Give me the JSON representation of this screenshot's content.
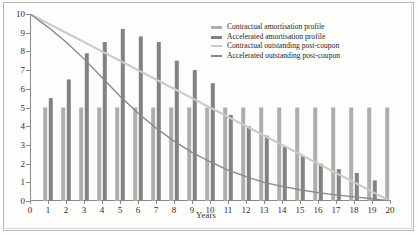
{
  "chart_data": {
    "type": "bar",
    "title": "",
    "subtitle": "",
    "xlabel": "Years",
    "ylabel": "",
    "xlim": [
      0,
      20
    ],
    "ylim": [
      0,
      10
    ],
    "grid": false,
    "legend_position": "top-right",
    "x": [
      0,
      1,
      2,
      3,
      4,
      5,
      6,
      7,
      8,
      9,
      10,
      11,
      12,
      13,
      14,
      15,
      16,
      17,
      18,
      19,
      20
    ],
    "categories": [
      "0",
      "1",
      "2",
      "3",
      "4",
      "5",
      "6",
      "7",
      "8",
      "9",
      "10",
      "11",
      "12",
      "13",
      "14",
      "15",
      "16",
      "17",
      "18",
      "19",
      "20"
    ],
    "y_ticks": [
      0,
      1,
      2,
      3,
      4,
      5,
      6,
      7,
      8,
      9,
      10
    ],
    "x_ticks": [
      0,
      1,
      2,
      3,
      4,
      5,
      6,
      7,
      8,
      9,
      10,
      11,
      12,
      13,
      14,
      15,
      16,
      17,
      18,
      19,
      20
    ],
    "series": [
      {
        "name": "Contractual amortisation profile",
        "kind": "bar",
        "color": "#b0aeaa",
        "values": [
          0,
          5.0,
          5.0,
          5.0,
          5.0,
          5.0,
          5.0,
          5.0,
          5.0,
          5.0,
          5.0,
          5.0,
          5.0,
          5.0,
          5.0,
          5.0,
          5.0,
          5.0,
          5.0,
          5.0,
          5.0
        ]
      },
      {
        "name": "Accelerated amortisation profile",
        "kind": "bar",
        "color": "#848280",
        "values": [
          0,
          5.5,
          6.5,
          7.9,
          8.5,
          9.2,
          8.8,
          8.5,
          7.5,
          7.0,
          6.3,
          4.6,
          4.0,
          3.5,
          2.9,
          2.4,
          2.0,
          1.7,
          1.5,
          1.1,
          0.85
        ]
      },
      {
        "name": "Contractual outstanding post-coupon",
        "kind": "line",
        "color": "#cdcbc7",
        "values": [
          10.0,
          9.5,
          9.0,
          8.5,
          8.0,
          7.5,
          7.0,
          6.5,
          6.0,
          5.5,
          5.0,
          4.5,
          4.0,
          3.5,
          3.0,
          2.5,
          2.0,
          1.5,
          1.0,
          0.5,
          0.0
        ]
      },
      {
        "name": "Accelerated outstanding post-coupon",
        "kind": "line",
        "color": "#8a8884",
        "values": [
          10.0,
          9.3,
          8.5,
          7.6,
          6.6,
          5.6,
          4.7,
          3.9,
          3.2,
          2.6,
          2.1,
          1.65,
          1.3,
          1.0,
          0.78,
          0.6,
          0.45,
          0.33,
          0.22,
          0.12,
          0.0
        ]
      }
    ]
  },
  "legend": {
    "items": [
      {
        "label": "Contractual amortisation profile",
        "color": "#b0aeaa",
        "marker": "bar-swatch"
      },
      {
        "label": "Accelerated amortisation profile",
        "color": "#848280",
        "marker": "bar-swatch"
      },
      {
        "label": "Contractual outstanding post-coupon",
        "color": "#cdcbc7",
        "marker": "line-swatch"
      },
      {
        "label": "Accelerated outstanding post-coupon",
        "color": "#8a8884",
        "marker": "line-swatch"
      }
    ]
  }
}
